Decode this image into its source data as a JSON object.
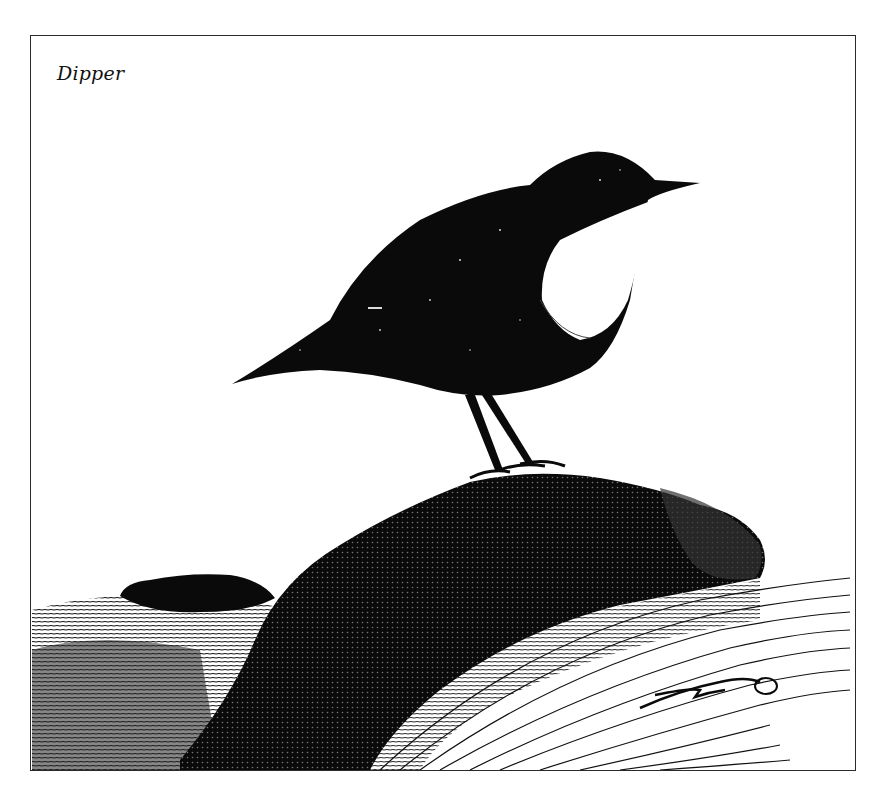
{
  "illustration": {
    "caption": "Dipper",
    "subject": "dipper-bird-on-rock",
    "signature": "RW",
    "signature_year": "72",
    "style": "pen-and-ink",
    "colors": {
      "ink": "#0a0a0a",
      "paper": "#ffffff",
      "frame": "#2a2a2a"
    }
  }
}
